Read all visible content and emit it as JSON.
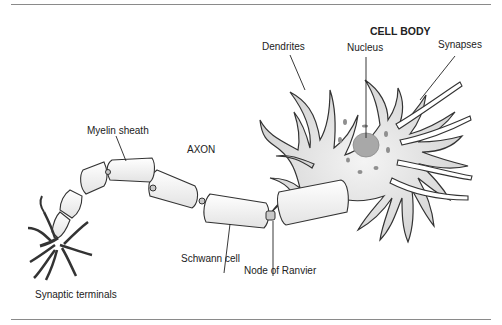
{
  "figure": {
    "labels": {
      "cell_body": "CELL BODY",
      "dendrites": "Dendrites",
      "nucleus": "Nucleus",
      "synapses": "Synapses",
      "myelin_sheath": "Myelin sheath",
      "axon": "AXON",
      "schwann_cell": "Schwann cell",
      "node_of_ranvier": "Node of Ranvier",
      "synaptic_terminals": "Synaptic terminals"
    },
    "colors": {
      "outline": "#333333",
      "cell_fill": "#d9d9d9",
      "myelin_fill": "#f2f2f2",
      "nucleus_fill": "#a8a8a8",
      "rule": "#8a8a8a"
    }
  }
}
